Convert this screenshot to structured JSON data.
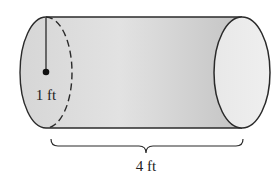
{
  "figure": {
    "shape": "cylinder",
    "radius_label": "1 ft",
    "length_label": "4 ft",
    "colors": {
      "body_fill_light": "#e4e4e4",
      "body_fill_dark": "#c2c2c2",
      "end_cap_fill": "#ebebeb",
      "stroke": "#2a2a2a"
    }
  }
}
